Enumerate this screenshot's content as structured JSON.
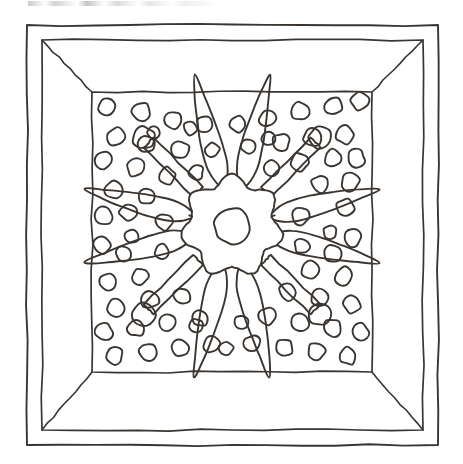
{
  "document": {
    "title": "Decorative Panel Line Drawing",
    "medium": "ink line drawing",
    "subject": "coffered ceiling panel with central rosette"
  },
  "canvas": {
    "width": 463,
    "height": 464,
    "background_color": "#ffffff"
  },
  "style": {
    "line_color": "#3a3530",
    "line_color_light": "#4a443d",
    "fill_color": "none",
    "outer_border_stroke": 1.9,
    "inner_border_stroke": 1.7,
    "bevel_stroke": 1.6,
    "panel_stroke": 1.7,
    "dot_stroke": 1.9,
    "motif_stroke": 1.9
  },
  "frame": {
    "outer_rect": {
      "x": 27,
      "y": 25,
      "width": 411,
      "height": 420
    },
    "inner_rect": {
      "x": 42,
      "y": 40,
      "width": 381,
      "height": 390
    },
    "panel_rect": {
      "x": 92,
      "y": 92,
      "width": 280,
      "height": 280
    },
    "bevel_description": "four trapezoidal chamfer faces connecting inner rect corners to panel corners"
  },
  "motif": {
    "center": {
      "x": 232,
      "y": 226
    },
    "rosette": {
      "lobes": 7,
      "outer_radius_max": 52,
      "outer_radius_min": 41,
      "hub_radius": 18,
      "hub_center": {
        "x": 232,
        "y": 226
      }
    },
    "rods": [
      {
        "angle_deg": 225,
        "inner_r": 48,
        "outer_r": 118,
        "half_width": 7,
        "knob_radius": 11
      },
      {
        "angle_deg": 315,
        "inner_r": 48,
        "outer_r": 118,
        "half_width": 7,
        "knob_radius": 11
      },
      {
        "angle_deg": 45,
        "inner_r": 48,
        "outer_r": 118,
        "half_width": 7,
        "knob_radius": 11
      },
      {
        "angle_deg": 135,
        "inner_r": 48,
        "outer_r": 118,
        "half_width": 7,
        "knob_radius": 11
      }
    ],
    "leaves": [
      {
        "angle_deg": 256,
        "length": 116,
        "width": 21,
        "tip_sharpness": 0.72,
        "name": "leaf-up-left"
      },
      {
        "angle_deg": 284,
        "length": 116,
        "width": 21,
        "tip_sharpness": 0.72,
        "name": "leaf-up-right"
      },
      {
        "angle_deg": 194,
        "length": 112,
        "width": 21,
        "tip_sharpness": 0.72,
        "name": "leaf-left-upper"
      },
      {
        "angle_deg": 166,
        "length": 112,
        "width": 21,
        "tip_sharpness": 0.72,
        "name": "leaf-left-lower"
      },
      {
        "angle_deg": 346,
        "length": 112,
        "width": 21,
        "tip_sharpness": 0.72,
        "name": "leaf-right-upper"
      },
      {
        "angle_deg": 14,
        "length": 112,
        "width": 21,
        "tip_sharpness": 0.72,
        "name": "leaf-right-lower"
      },
      {
        "angle_deg": 76,
        "length": 116,
        "width": 21,
        "tip_sharpness": 0.72,
        "name": "leaf-down-right"
      },
      {
        "angle_deg": 104,
        "length": 116,
        "width": 21,
        "tip_sharpness": 0.72,
        "name": "leaf-down-left"
      }
    ]
  },
  "stipple": {
    "description": "field of small irregular hand-drawn circles filling the panel around the motif",
    "radius_min": 7.0,
    "radius_max": 10.0,
    "count": 76,
    "dots": [
      {
        "x": 107,
        "y": 106,
        "r": 8.6
      },
      {
        "x": 141,
        "y": 112,
        "r": 9.0
      },
      {
        "x": 173,
        "y": 120,
        "r": 8.4
      },
      {
        "x": 205,
        "y": 125,
        "r": 8.2
      },
      {
        "x": 238,
        "y": 124,
        "r": 8.0
      },
      {
        "x": 268,
        "y": 118,
        "r": 8.6
      },
      {
        "x": 300,
        "y": 111,
        "r": 8.8
      },
      {
        "x": 333,
        "y": 106,
        "r": 8.4
      },
      {
        "x": 360,
        "y": 101,
        "r": 8.6
      },
      {
        "x": 116,
        "y": 137,
        "r": 9.0
      },
      {
        "x": 147,
        "y": 144,
        "r": 8.4
      },
      {
        "x": 180,
        "y": 150,
        "r": 8.6
      },
      {
        "x": 281,
        "y": 142,
        "r": 8.4
      },
      {
        "x": 312,
        "y": 138,
        "r": 8.8
      },
      {
        "x": 345,
        "y": 135,
        "r": 8.6
      },
      {
        "x": 104,
        "y": 160,
        "r": 8.4
      },
      {
        "x": 136,
        "y": 168,
        "r": 8.6
      },
      {
        "x": 167,
        "y": 176,
        "r": 8.4
      },
      {
        "x": 300,
        "y": 162,
        "r": 8.6
      },
      {
        "x": 333,
        "y": 158,
        "r": 8.2
      },
      {
        "x": 356,
        "y": 158,
        "r": 8.6
      },
      {
        "x": 114,
        "y": 190,
        "r": 8.6
      },
      {
        "x": 146,
        "y": 196,
        "r": 8.0
      },
      {
        "x": 320,
        "y": 184,
        "r": 8.6
      },
      {
        "x": 350,
        "y": 182,
        "r": 8.8
      },
      {
        "x": 104,
        "y": 216,
        "r": 8.6
      },
      {
        "x": 128,
        "y": 212,
        "r": 8.2
      },
      {
        "x": 345,
        "y": 208,
        "r": 9.0
      },
      {
        "x": 102,
        "y": 246,
        "r": 8.4
      },
      {
        "x": 352,
        "y": 238,
        "r": 8.6
      },
      {
        "x": 124,
        "y": 254,
        "r": 8.2
      },
      {
        "x": 332,
        "y": 254,
        "r": 8.4
      },
      {
        "x": 108,
        "y": 282,
        "r": 8.6
      },
      {
        "x": 140,
        "y": 276,
        "r": 8.0
      },
      {
        "x": 310,
        "y": 270,
        "r": 8.6
      },
      {
        "x": 344,
        "y": 276,
        "r": 8.8
      },
      {
        "x": 116,
        "y": 308,
        "r": 8.4
      },
      {
        "x": 150,
        "y": 300,
        "r": 8.4
      },
      {
        "x": 182,
        "y": 296,
        "r": 8.2
      },
      {
        "x": 288,
        "y": 292,
        "r": 8.4
      },
      {
        "x": 320,
        "y": 298,
        "r": 8.6
      },
      {
        "x": 352,
        "y": 304,
        "r": 8.6
      },
      {
        "x": 104,
        "y": 332,
        "r": 8.4
      },
      {
        "x": 136,
        "y": 328,
        "r": 8.2
      },
      {
        "x": 168,
        "y": 322,
        "r": 8.4
      },
      {
        "x": 200,
        "y": 318,
        "r": 8.0
      },
      {
        "x": 268,
        "y": 316,
        "r": 8.4
      },
      {
        "x": 300,
        "y": 322,
        "r": 8.6
      },
      {
        "x": 332,
        "y": 328,
        "r": 8.4
      },
      {
        "x": 360,
        "y": 332,
        "r": 8.6
      },
      {
        "x": 114,
        "y": 356,
        "r": 8.6
      },
      {
        "x": 148,
        "y": 352,
        "r": 8.4
      },
      {
        "x": 180,
        "y": 348,
        "r": 8.2
      },
      {
        "x": 212,
        "y": 344,
        "r": 8.4
      },
      {
        "x": 252,
        "y": 344,
        "r": 8.2
      },
      {
        "x": 284,
        "y": 348,
        "r": 8.4
      },
      {
        "x": 316,
        "y": 352,
        "r": 8.6
      },
      {
        "x": 348,
        "y": 356,
        "r": 8.4
      },
      {
        "x": 164,
        "y": 222,
        "r": 8.2
      },
      {
        "x": 300,
        "y": 216,
        "r": 8.4
      },
      {
        "x": 154,
        "y": 133,
        "r": 6.4
      },
      {
        "x": 212,
        "y": 150,
        "r": 7.0
      },
      {
        "x": 248,
        "y": 146,
        "r": 7.0
      },
      {
        "x": 196,
        "y": 172,
        "r": 7.2
      },
      {
        "x": 272,
        "y": 168,
        "r": 7.2
      },
      {
        "x": 132,
        "y": 236,
        "r": 7.0
      },
      {
        "x": 330,
        "y": 232,
        "r": 7.0
      },
      {
        "x": 162,
        "y": 252,
        "r": 7.2
      },
      {
        "x": 302,
        "y": 246,
        "r": 7.2
      },
      {
        "x": 196,
        "y": 326,
        "r": 7.0
      },
      {
        "x": 242,
        "y": 322,
        "r": 7.0
      },
      {
        "x": 268,
        "y": 138,
        "r": 6.8
      },
      {
        "x": 190,
        "y": 128,
        "r": 6.6
      },
      {
        "x": 226,
        "y": 348,
        "r": 6.8
      }
    ]
  }
}
